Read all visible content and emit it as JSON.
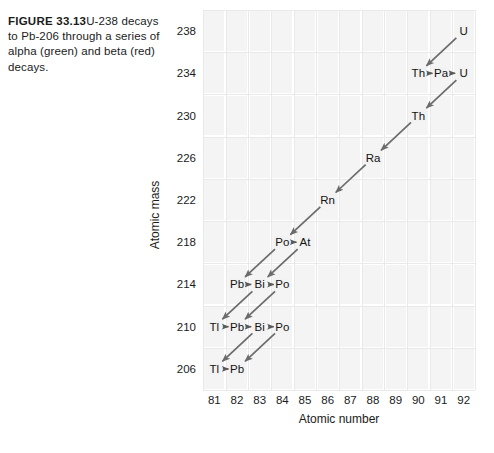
{
  "caption": {
    "label": "FIGURE 33.13",
    "text": "U-238 decays to Pb-206 through a series of alpha (green) and beta (red) decays."
  },
  "axes": {
    "xlabel": "Atomic number",
    "ylabel": "Atomic mass",
    "xticks": [
      "81",
      "82",
      "83",
      "84",
      "85",
      "86",
      "87",
      "88",
      "89",
      "90",
      "91",
      "92"
    ],
    "yticks": [
      "238",
      "234",
      "230",
      "226",
      "222",
      "218",
      "214",
      "210",
      "206"
    ]
  },
  "chart_data": {
    "type": "scatter",
    "title": "",
    "xlabel": "Atomic number",
    "ylabel": "Atomic mass",
    "xlim": [
      80.5,
      92.5
    ],
    "ylim": [
      204,
      240
    ],
    "grid": true,
    "legend": null,
    "x": [
      92,
      90,
      91,
      92,
      90,
      88,
      86,
      84,
      85,
      82,
      83,
      84,
      81,
      82,
      83,
      84,
      81,
      82
    ],
    "y": [
      238,
      234,
      234,
      234,
      230,
      226,
      222,
      218,
      218,
      214,
      214,
      214,
      210,
      210,
      210,
      210,
      206,
      206
    ],
    "nuclides": [
      {
        "symbol": "U",
        "z": 92,
        "a": 238
      },
      {
        "symbol": "Th",
        "z": 90,
        "a": 234
      },
      {
        "symbol": "Pa",
        "z": 91,
        "a": 234
      },
      {
        "symbol": "U",
        "z": 92,
        "a": 234
      },
      {
        "symbol": "Th",
        "z": 90,
        "a": 230
      },
      {
        "symbol": "Ra",
        "z": 88,
        "a": 226
      },
      {
        "symbol": "Rn",
        "z": 86,
        "a": 222
      },
      {
        "symbol": "Po",
        "z": 84,
        "a": 218
      },
      {
        "symbol": "At",
        "z": 85,
        "a": 218
      },
      {
        "symbol": "Pb",
        "z": 82,
        "a": 214
      },
      {
        "symbol": "Bi",
        "z": 83,
        "a": 214
      },
      {
        "symbol": "Po",
        "z": 84,
        "a": 214
      },
      {
        "symbol": "Tl",
        "z": 81,
        "a": 210
      },
      {
        "symbol": "Pb",
        "z": 82,
        "a": 210
      },
      {
        "symbol": "Bi",
        "z": 83,
        "a": 210
      },
      {
        "symbol": "Po",
        "z": 84,
        "a": 210
      },
      {
        "symbol": "Tl",
        "z": 81,
        "a": 206
      },
      {
        "symbol": "Pb",
        "z": 82,
        "a": 206
      }
    ],
    "decays": [
      {
        "type": "alpha",
        "from_z": 92,
        "from_a": 238,
        "to_z": 90,
        "to_a": 234
      },
      {
        "type": "beta",
        "from_z": 90,
        "from_a": 234,
        "to_z": 91,
        "to_a": 234
      },
      {
        "type": "beta",
        "from_z": 91,
        "from_a": 234,
        "to_z": 92,
        "to_a": 234
      },
      {
        "type": "alpha",
        "from_z": 92,
        "from_a": 234,
        "to_z": 90,
        "to_a": 230
      },
      {
        "type": "alpha",
        "from_z": 90,
        "from_a": 230,
        "to_z": 88,
        "to_a": 226
      },
      {
        "type": "alpha",
        "from_z": 88,
        "from_a": 226,
        "to_z": 86,
        "to_a": 222
      },
      {
        "type": "alpha",
        "from_z": 86,
        "from_a": 222,
        "to_z": 84,
        "to_a": 218
      },
      {
        "type": "beta",
        "from_z": 84,
        "from_a": 218,
        "to_z": 85,
        "to_a": 218
      },
      {
        "type": "alpha",
        "from_z": 84,
        "from_a": 218,
        "to_z": 82,
        "to_a": 214
      },
      {
        "type": "alpha",
        "from_z": 85,
        "from_a": 218,
        "to_z": 83,
        "to_a": 214
      },
      {
        "type": "beta",
        "from_z": 82,
        "from_a": 214,
        "to_z": 83,
        "to_a": 214
      },
      {
        "type": "beta",
        "from_z": 83,
        "from_a": 214,
        "to_z": 84,
        "to_a": 214
      },
      {
        "type": "alpha",
        "from_z": 83,
        "from_a": 214,
        "to_z": 81,
        "to_a": 210
      },
      {
        "type": "alpha",
        "from_z": 84,
        "from_a": 214,
        "to_z": 82,
        "to_a": 210
      },
      {
        "type": "beta",
        "from_z": 81,
        "from_a": 210,
        "to_z": 82,
        "to_a": 210
      },
      {
        "type": "beta",
        "from_z": 82,
        "from_a": 210,
        "to_z": 83,
        "to_a": 210
      },
      {
        "type": "beta",
        "from_z": 83,
        "from_a": 210,
        "to_z": 84,
        "to_a": 210
      },
      {
        "type": "alpha",
        "from_z": 83,
        "from_a": 210,
        "to_z": 81,
        "to_a": 206
      },
      {
        "type": "alpha",
        "from_z": 84,
        "from_a": 210,
        "to_z": 82,
        "to_a": 206
      },
      {
        "type": "beta",
        "from_z": 81,
        "from_a": 206,
        "to_z": 82,
        "to_a": 206
      }
    ]
  },
  "colors": {
    "alpha_arrow": "#6b6b6b",
    "beta_arrow": "#5a5a5a",
    "grid": "#e9e9e9",
    "cell": "#f4f4f4",
    "text": "#1a1a1a"
  }
}
